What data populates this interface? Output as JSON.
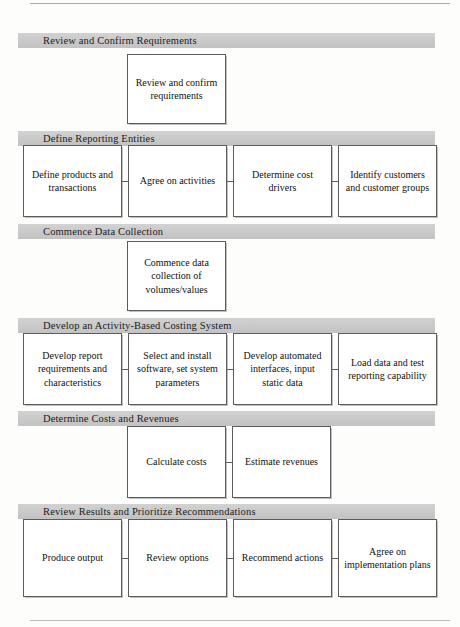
{
  "diagram": {
    "band_color": "#c9c9c9",
    "box_border_color": "#5c5c5c",
    "box_fill_color": "#ffffff",
    "sections": [
      {
        "id": "review-and-confirm-requirements",
        "header": "Review and Confirm Requirements",
        "band_top": 33,
        "box_top": 54,
        "box_height": 70,
        "layout": "center-1",
        "boxes": [
          {
            "label": "Review and confirm requirements",
            "left": 127,
            "width": 99
          }
        ],
        "connectors": []
      },
      {
        "id": "define-reporting-entities",
        "header": "Define Reporting Entities",
        "band_top": 131,
        "box_top": 145,
        "box_height": 72,
        "layout": "row-4",
        "boxes": [
          {
            "label": "Define products and transactions",
            "left": 23,
            "width": 99
          },
          {
            "label": "Agree on activities",
            "left": 128,
            "width": 99
          },
          {
            "label": "Determine cost drivers",
            "left": 233,
            "width": 99
          },
          {
            "label": "Identify customers and customer groups",
            "left": 338,
            "width": 99
          }
        ],
        "connectors": [
          {
            "left": 122,
            "width": 6
          },
          {
            "left": 227,
            "width": 6
          },
          {
            "left": 332,
            "width": 6
          }
        ]
      },
      {
        "id": "commence-data-collection",
        "header": "Commence Data Collection",
        "band_top": 224,
        "box_top": 241,
        "box_height": 70,
        "layout": "center-1",
        "boxes": [
          {
            "label": "Commence data collection of volumes/values",
            "left": 127,
            "width": 99
          }
        ],
        "connectors": []
      },
      {
        "id": "develop-an-activity-based-costing-system",
        "header": "Develop an Activity-Based Costing System",
        "band_top": 318,
        "box_top": 333,
        "box_height": 72,
        "layout": "row-4",
        "boxes": [
          {
            "label": "Develop report requirements and characteristics",
            "left": 23,
            "width": 99
          },
          {
            "label": "Select and install software, set system parameters",
            "left": 128,
            "width": 99
          },
          {
            "label": "Develop automated interfaces, input static data",
            "left": 233,
            "width": 99
          },
          {
            "label": "Load data and test reporting capability",
            "left": 338,
            "width": 99
          }
        ],
        "connectors": [
          {
            "left": 122,
            "width": 6
          },
          {
            "left": 227,
            "width": 6
          },
          {
            "left": 332,
            "width": 6
          }
        ]
      },
      {
        "id": "determine-costs-and-revenues",
        "header": "Determine Costs and Revenues",
        "band_top": 411,
        "box_top": 426,
        "box_height": 72,
        "layout": "center-2",
        "boxes": [
          {
            "label": "Calculate costs",
            "left": 127,
            "width": 99
          },
          {
            "label": "Estimate revenues",
            "left": 232,
            "width": 99
          }
        ],
        "connectors": [
          {
            "left": 226,
            "width": 6
          }
        ]
      },
      {
        "id": "review-results-and-prioritize-recommendations",
        "header": "Review Results and Prioritize Recommendations",
        "band_top": 504,
        "box_top": 519,
        "box_height": 78,
        "layout": "row-4",
        "boxes": [
          {
            "label": "Produce output",
            "left": 23,
            "width": 99
          },
          {
            "label": "Review options",
            "left": 128,
            "width": 99
          },
          {
            "label": "Recommend actions",
            "left": 233,
            "width": 99
          },
          {
            "label": "Agree on implementation plans",
            "left": 338,
            "width": 99
          }
        ],
        "connectors": [
          {
            "left": 122,
            "width": 6
          },
          {
            "left": 227,
            "width": 6
          },
          {
            "left": 332,
            "width": 6
          }
        ]
      }
    ]
  }
}
